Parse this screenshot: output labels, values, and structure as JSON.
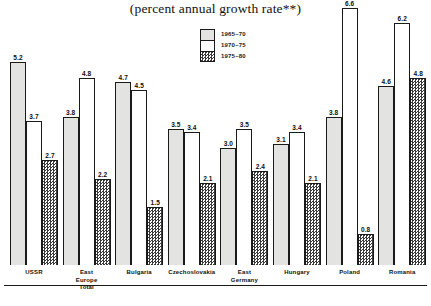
{
  "chart_data": {
    "type": "bar",
    "title": "(percent annual growth rate**)",
    "xlabel": "",
    "ylabel": "",
    "ylim": [
      0,
      6.8
    ],
    "grid": false,
    "legend_position": "top-center",
    "categories": [
      "USSR",
      "East Europe\nTotal",
      "Bulgaria",
      "Czechoslovakia",
      "East Germany",
      "Hungary",
      "Poland",
      "Romania"
    ],
    "series": [
      {
        "name": "1965–70",
        "fill": "light-gray",
        "values": [
          5.2,
          3.8,
          4.7,
          3.5,
          3.0,
          3.1,
          3.8,
          4.6
        ]
      },
      {
        "name": "1970–75",
        "fill": "white",
        "values": [
          3.7,
          4.8,
          4.5,
          3.4,
          3.5,
          3.4,
          6.6,
          6.2
        ]
      },
      {
        "name": "1975–80",
        "fill": "checkered",
        "values": [
          2.7,
          2.2,
          1.5,
          2.1,
          2.4,
          2.1,
          0.8,
          4.8
        ]
      }
    ],
    "value_labels": [
      [
        "5.2",
        "3.7",
        "2.7"
      ],
      [
        "3.8",
        "4.8",
        "2.2"
      ],
      [
        "4.7",
        "4.5",
        "1.5"
      ],
      [
        "3.5",
        "3.4",
        "2.1"
      ],
      [
        "3.0",
        "3.5",
        "2.4"
      ],
      [
        "3.1",
        "3.4",
        "2.1"
      ],
      [
        "3.8",
        "6.6",
        "0.8"
      ],
      [
        "4.6",
        "6.2",
        "4.8"
      ]
    ]
  },
  "legend": {
    "items": [
      {
        "label": "1965–70",
        "fill_class": "fill-p1"
      },
      {
        "label": "1970–75",
        "fill_class": "fill-p2"
      },
      {
        "label": "1975–80",
        "fill_class": "fill-p3"
      }
    ]
  },
  "colors": {
    "series_1965_70": "#e3e3e1",
    "series_1970_75": "#ffffff",
    "series_1975_80_ink": "#3a3a3a",
    "outline": "#1a1a1a",
    "text": "#111111",
    "background": "#ffffff"
  }
}
